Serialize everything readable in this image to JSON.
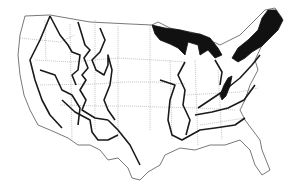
{
  "map": {
    "subject": "Contiguous United States",
    "style": "black-and-white outline map",
    "layers": [
      "state boundaries",
      "region boundaries",
      "highlighted regions"
    ],
    "highlighted_regions": [
      {
        "name": "northern-great-lakes-region",
        "fill": "#111111"
      },
      {
        "name": "northern-new-england-region",
        "fill": "#111111"
      },
      {
        "name": "central-appalachian-region",
        "fill": "#111111"
      }
    ],
    "colors": {
      "background": "#ffffff",
      "boundary": "#1a1a1a",
      "state_line": "#9a9a9a",
      "highlight": "#111111"
    }
  }
}
